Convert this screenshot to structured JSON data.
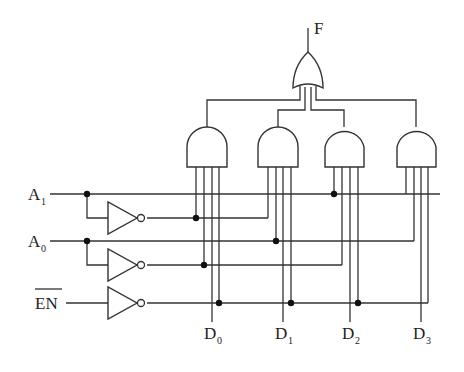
{
  "diagram": {
    "output": {
      "label": "F"
    },
    "inputs": [
      {
        "label": "A",
        "subscript": "1"
      },
      {
        "label": "A",
        "subscript": "0"
      },
      {
        "label": "EN",
        "overline": true
      }
    ],
    "data_inputs": [
      {
        "label": "D",
        "subscript": "0"
      },
      {
        "label": "D",
        "subscript": "1"
      },
      {
        "label": "D",
        "subscript": "2"
      },
      {
        "label": "D",
        "subscript": "3"
      }
    ],
    "gates": {
      "or_gate": {
        "type": "OR",
        "inputs": 4,
        "output": "F"
      },
      "and_gates": [
        {
          "id": "AND0",
          "inputs": [
            "A1'",
            "A0'",
            "D0",
            "EN'"
          ]
        },
        {
          "id": "AND1",
          "inputs": [
            "A1'",
            "A0",
            "D1",
            "EN'"
          ]
        },
        {
          "id": "AND2",
          "inputs": [
            "A1",
            "A0'",
            "D2",
            "EN'"
          ]
        },
        {
          "id": "AND3",
          "inputs": [
            "A1",
            "A0",
            "D3",
            "EN'"
          ]
        }
      ],
      "inverters": [
        "A1",
        "A0",
        "EN"
      ]
    },
    "colors": {
      "line": "#333333",
      "background": "#ffffff"
    }
  }
}
